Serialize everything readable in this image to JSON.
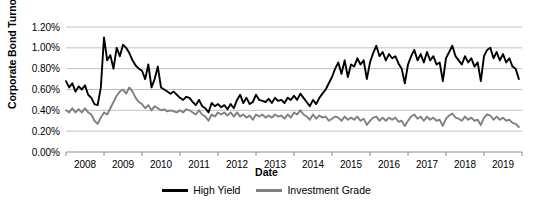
{
  "chart_data": {
    "type": "line",
    "title": "",
    "xlabel": "Date",
    "ylabel": "Corporate Bond Turnover (%)",
    "ylim": [
      0.0,
      1.2
    ],
    "xlim": [
      2008.0,
      2020.0
    ],
    "yticks": [
      0.0,
      0.2,
      0.4,
      0.6,
      0.8,
      1.0,
      1.2
    ],
    "ytick_labels": [
      "0.00%",
      "0.20%",
      "0.40%",
      "0.60%",
      "0.80%",
      "1.00%",
      "1.20%"
    ],
    "xticks": [
      2008,
      2009,
      2010,
      2011,
      2012,
      2013,
      2014,
      2015,
      2016,
      2017,
      2018,
      2019
    ],
    "xtick_labels": [
      "2008",
      "2009",
      "2010",
      "2011",
      "2012",
      "2013",
      "2014",
      "2015",
      "2016",
      "2017",
      "2018",
      "2019"
    ],
    "grid": "horizontal",
    "legend_position": "bottom-center",
    "colors": {
      "high_yield": "#000000",
      "investment_grade": "#808080",
      "gridline": "#b0b0b0",
      "axis": "#7f7f7f",
      "background": "#ffffff"
    },
    "x_step_months": 1,
    "x_start": 2008.0,
    "series": [
      {
        "name": "High Yield",
        "color": "#000000",
        "values": [
          0.68,
          0.62,
          0.66,
          0.58,
          0.63,
          0.6,
          0.64,
          0.55,
          0.52,
          0.46,
          0.45,
          0.62,
          1.1,
          0.88,
          0.93,
          0.8,
          1.0,
          0.92,
          1.03,
          1.0,
          0.95,
          0.88,
          0.83,
          0.8,
          0.78,
          0.7,
          0.84,
          0.62,
          0.7,
          0.82,
          0.62,
          0.6,
          0.58,
          0.56,
          0.58,
          0.55,
          0.52,
          0.5,
          0.53,
          0.52,
          0.48,
          0.45,
          0.5,
          0.44,
          0.42,
          0.38,
          0.47,
          0.44,
          0.46,
          0.43,
          0.45,
          0.41,
          0.46,
          0.42,
          0.5,
          0.55,
          0.47,
          0.52,
          0.46,
          0.48,
          0.55,
          0.5,
          0.49,
          0.48,
          0.51,
          0.47,
          0.52,
          0.49,
          0.5,
          0.47,
          0.52,
          0.5,
          0.54,
          0.5,
          0.56,
          0.52,
          0.48,
          0.44,
          0.5,
          0.46,
          0.52,
          0.56,
          0.6,
          0.66,
          0.72,
          0.8,
          0.86,
          0.75,
          0.88,
          0.72,
          0.84,
          0.82,
          0.9,
          0.84,
          0.88,
          0.7,
          0.86,
          0.95,
          1.02,
          0.92,
          0.96,
          0.88,
          0.94,
          0.9,
          0.92,
          0.85,
          0.8,
          0.66,
          0.84,
          0.92,
          0.98,
          0.88,
          0.94,
          0.86,
          0.96,
          0.88,
          0.92,
          0.84,
          0.86,
          0.68,
          0.9,
          0.96,
          1.02,
          0.92,
          0.88,
          0.84,
          0.92,
          0.86,
          0.9,
          0.82,
          0.86,
          0.68,
          0.92,
          0.98,
          1.0,
          0.9,
          0.96,
          0.88,
          0.94,
          0.86,
          0.9,
          0.82,
          0.8,
          0.7
        ]
      },
      {
        "name": "Investment Grade",
        "color": "#808080",
        "values": [
          0.4,
          0.38,
          0.42,
          0.38,
          0.41,
          0.38,
          0.42,
          0.38,
          0.36,
          0.3,
          0.27,
          0.33,
          0.38,
          0.36,
          0.42,
          0.48,
          0.54,
          0.58,
          0.6,
          0.56,
          0.62,
          0.58,
          0.52,
          0.48,
          0.46,
          0.42,
          0.45,
          0.4,
          0.44,
          0.42,
          0.4,
          0.41,
          0.39,
          0.4,
          0.39,
          0.38,
          0.4,
          0.38,
          0.41,
          0.4,
          0.38,
          0.36,
          0.4,
          0.36,
          0.34,
          0.3,
          0.36,
          0.34,
          0.38,
          0.36,
          0.38,
          0.35,
          0.38,
          0.34,
          0.38,
          0.34,
          0.36,
          0.33,
          0.35,
          0.31,
          0.36,
          0.34,
          0.36,
          0.33,
          0.35,
          0.33,
          0.36,
          0.34,
          0.35,
          0.32,
          0.36,
          0.33,
          0.38,
          0.36,
          0.4,
          0.36,
          0.34,
          0.31,
          0.36,
          0.32,
          0.35,
          0.33,
          0.34,
          0.3,
          0.32,
          0.34,
          0.33,
          0.3,
          0.34,
          0.31,
          0.33,
          0.31,
          0.34,
          0.3,
          0.32,
          0.26,
          0.3,
          0.33,
          0.34,
          0.3,
          0.33,
          0.3,
          0.33,
          0.31,
          0.33,
          0.29,
          0.3,
          0.25,
          0.3,
          0.34,
          0.36,
          0.32,
          0.34,
          0.3,
          0.34,
          0.31,
          0.33,
          0.3,
          0.31,
          0.25,
          0.32,
          0.35,
          0.37,
          0.33,
          0.32,
          0.3,
          0.34,
          0.31,
          0.33,
          0.3,
          0.31,
          0.26,
          0.33,
          0.36,
          0.35,
          0.31,
          0.34,
          0.31,
          0.33,
          0.3,
          0.31,
          0.28,
          0.27,
          0.24
        ]
      }
    ]
  },
  "legend": {
    "items": [
      {
        "label": "High Yield",
        "color": "#000000"
      },
      {
        "label": "Investment Grade",
        "color": "#808080"
      }
    ]
  },
  "axes": {
    "x_title": "Date",
    "y_title": "Corporate Bond Turnover (%)"
  }
}
